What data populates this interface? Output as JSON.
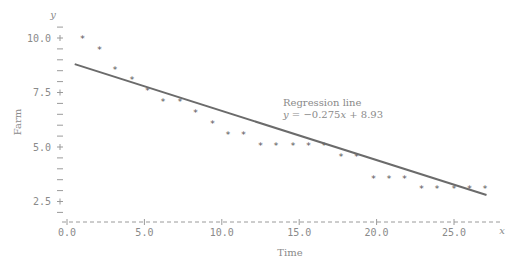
{
  "chart_data": {
    "type": "scatter",
    "title": "",
    "xlabel": "Time",
    "ylabel": "Farm",
    "x_axis_var": "x",
    "y_axis_var": "y",
    "xlim": [
      0,
      28.5
    ],
    "ylim": [
      1.6,
      10.6
    ],
    "x_ticks": [
      "0.0",
      "5.0",
      "10.0",
      "15.0",
      "20.0",
      "25.0"
    ],
    "y_ticks": [
      "2.5",
      "5.0",
      "7.5",
      "10.0"
    ],
    "grid": false,
    "series": [
      {
        "name": "Farm",
        "marker": "*",
        "x": [
          1.0,
          2.1,
          3.1,
          4.2,
          5.2,
          6.2,
          7.3,
          8.3,
          9.4,
          10.4,
          11.4,
          12.5,
          13.5,
          14.6,
          15.6,
          16.6,
          17.7,
          18.7,
          19.8,
          20.8,
          21.8,
          22.9,
          23.9,
          25.0,
          26.0,
          27.0
        ],
        "y": [
          10.0,
          9.5,
          8.6,
          8.1,
          7.6,
          7.1,
          7.1,
          6.6,
          6.1,
          5.6,
          5.6,
          5.1,
          5.1,
          5.1,
          5.1,
          5.1,
          4.6,
          4.6,
          3.6,
          3.6,
          3.6,
          3.1,
          3.1,
          3.1,
          3.1,
          3.1
        ]
      }
    ],
    "regression": {
      "label_line1": "Regression line",
      "label_line2": "y = −0.275x + 8.93",
      "slope": -0.275,
      "intercept": 8.93,
      "drawn_from": [
        0.5,
        8.8
      ],
      "drawn_to": [
        27.1,
        2.8
      ]
    }
  }
}
